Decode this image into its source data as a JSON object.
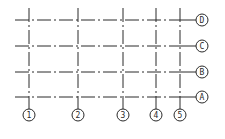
{
  "diagram": {
    "type": "structural-axis-grid",
    "line_color": "#2a2a2a",
    "background": "#ffffff",
    "horizontal_axes": [
      {
        "label": "D"
      },
      {
        "label": "C"
      },
      {
        "label": "B"
      },
      {
        "label": "A"
      }
    ],
    "vertical_axes": [
      {
        "label": "1"
      },
      {
        "label": "2"
      },
      {
        "label": "3"
      },
      {
        "label": "4"
      },
      {
        "label": "5"
      }
    ]
  }
}
